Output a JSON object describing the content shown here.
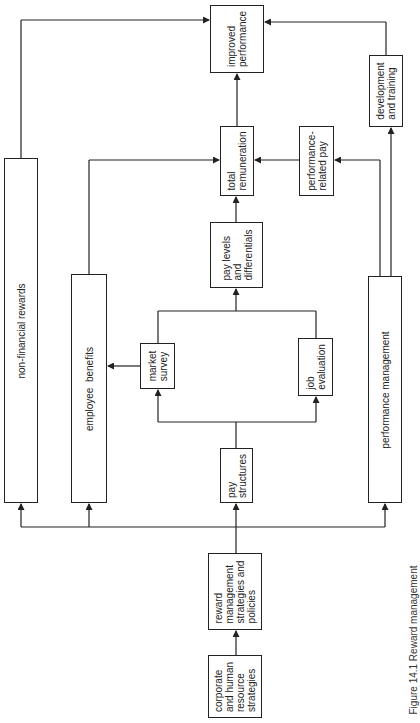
{
  "diagram": {
    "orientation": "rotated 90 degrees counter-clockwise (flow from bottom to top)",
    "nodes": {
      "corporate": "corporate\nand human\nresource\nstrategies",
      "reward_mgmt": "reward\nmanagement\nstrategies and\npolicies",
      "pay_structures": "pay\nstructures",
      "market_survey": "market\nsurvey",
      "job_evaluation": "job\nevaluation",
      "pay_levels": "pay levels\nand\ndifferentials",
      "total_remuneration": "total\nremuneration",
      "performance_related_pay": "performance-\nrelated pay",
      "improved_performance": "improved\nperformance",
      "development_training": "development\nand training",
      "non_financial_rewards": "non-financial rewards",
      "employee_benefits": "employee  benefits",
      "performance_management": "performance management"
    },
    "edges": [
      [
        "corporate",
        "reward_mgmt"
      ],
      [
        "reward_mgmt",
        "pay_structures"
      ],
      [
        "reward_mgmt",
        "non_financial_rewards"
      ],
      [
        "reward_mgmt",
        "employee_benefits"
      ],
      [
        "reward_mgmt",
        "performance_management"
      ],
      [
        "pay_structures",
        "market_survey"
      ],
      [
        "pay_structures",
        "job_evaluation"
      ],
      [
        "market_survey",
        "employee_benefits"
      ],
      [
        "market_survey",
        "pay_levels"
      ],
      [
        "job_evaluation",
        "pay_levels"
      ],
      [
        "pay_levels",
        "total_remuneration"
      ],
      [
        "employee_benefits",
        "total_remuneration"
      ],
      [
        "performance_management",
        "performance_related_pay"
      ],
      [
        "performance_management",
        "development_training"
      ],
      [
        "performance_related_pay",
        "total_remuneration"
      ],
      [
        "total_remuneration",
        "improved_performance"
      ],
      [
        "non_financial_rewards",
        "improved_performance"
      ],
      [
        "development_training",
        "improved_performance"
      ]
    ],
    "caption": "Figure 14.1  Reward management"
  }
}
